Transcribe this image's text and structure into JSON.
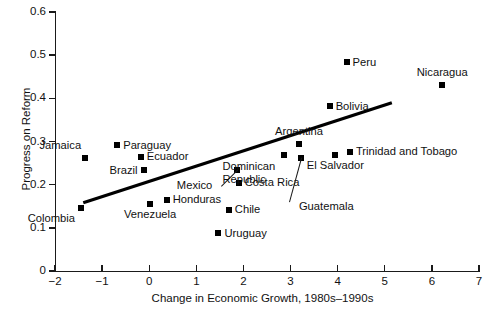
{
  "chart_data": {
    "type": "scatter",
    "title": "",
    "xlabel": "Change in Economic Growth, 1980s–1990s",
    "ylabel": "Progress on Reform",
    "xlim": [
      -2,
      7
    ],
    "ylim": [
      0,
      0.6
    ],
    "xticks": [
      "−2",
      "−1",
      "0",
      "1",
      "2",
      "3",
      "4",
      "5",
      "6",
      "7"
    ],
    "yticks": [
      "0",
      "0.1",
      "0.2",
      "0.3",
      "0.4",
      "0.5",
      "0.6"
    ],
    "grid": false,
    "legend": "none",
    "marker_color": "#000000",
    "trendline": {
      "label": "fitted regression line",
      "x_start": -1.4,
      "y_start": 0.158,
      "x_end": 5.15,
      "y_end": 0.39
    },
    "points": [
      {
        "name": "Colombia",
        "x": -1.45,
        "y": 0.145,
        "label_pos": "below-left"
      },
      {
        "name": "Jamaica",
        "x": -1.36,
        "y": 0.261,
        "label_pos": "above-left"
      },
      {
        "name": "Paraguay",
        "x": -0.68,
        "y": 0.291,
        "label_pos": "right"
      },
      {
        "name": "Ecuador",
        "x": -0.18,
        "y": 0.265,
        "label_pos": "right"
      },
      {
        "name": "Brazil",
        "x": -0.12,
        "y": 0.233,
        "label_pos": "left"
      },
      {
        "name": "Venezuela",
        "x": 0.02,
        "y": 0.155,
        "label_pos": "below"
      },
      {
        "name": "Honduras",
        "x": 0.37,
        "y": 0.165,
        "label_pos": "right"
      },
      {
        "name": "Uruguay",
        "x": 1.47,
        "y": 0.087,
        "label_pos": "right"
      },
      {
        "name": "Chile",
        "x": 1.69,
        "y": 0.142,
        "label_pos": "right"
      },
      {
        "name": "Mexico",
        "x": 1.86,
        "y": 0.234,
        "label_pos": "leader-left"
      },
      {
        "name": "Costa Rica",
        "x": 1.9,
        "y": 0.204,
        "label_pos": "right"
      },
      {
        "name": "Dominican Republic",
        "x": 2.87,
        "y": 0.268,
        "label_pos": "below"
      },
      {
        "name": "Argentina",
        "x": 3.18,
        "y": 0.295,
        "label_pos": "above"
      },
      {
        "name": "Guatemala",
        "x": 3.22,
        "y": 0.262,
        "label_pos": "leader-below"
      },
      {
        "name": "Bolivia",
        "x": 3.83,
        "y": 0.382,
        "label_pos": "right"
      },
      {
        "name": "El Salvador",
        "x": 3.95,
        "y": 0.268,
        "label_pos": "below"
      },
      {
        "name": "Peru",
        "x": 4.19,
        "y": 0.484,
        "label_pos": "right"
      },
      {
        "name": "Trinidad and Tobago",
        "x": 4.26,
        "y": 0.276,
        "label_pos": "right"
      },
      {
        "name": "Nicaragua",
        "x": 6.22,
        "y": 0.431,
        "label_pos": "above"
      }
    ]
  }
}
